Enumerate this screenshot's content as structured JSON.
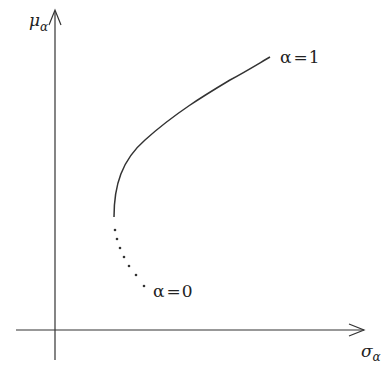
{
  "diagram": {
    "type": "efficient-frontier-sketch",
    "colors": {
      "stroke": "#333333",
      "text": "#222222",
      "background": "#ffffff"
    },
    "axes": {
      "x": {
        "label_main": "σ",
        "label_sub": "α"
      },
      "y": {
        "label_main": "μ",
        "label_sub": "α"
      }
    },
    "curve": {
      "start_label": "α=0",
      "end_label": "α=1",
      "solid_segment": "upper branch from vertex to α=1",
      "dotted_segment": "lower branch from vertex to α=0"
    },
    "labels": {
      "alpha1": {
        "sym": "α",
        "eq": "=",
        "val": "1"
      },
      "alpha0": {
        "sym": "α",
        "eq": "=",
        "val": "0"
      }
    }
  }
}
